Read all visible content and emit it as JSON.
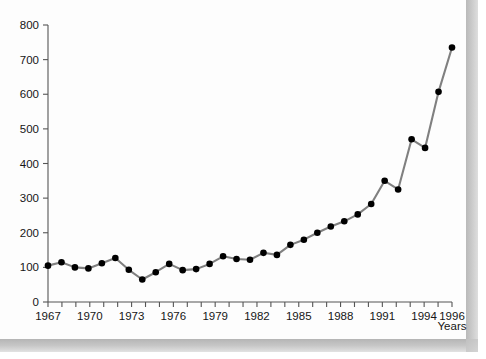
{
  "chart_data": {
    "type": "line",
    "title": "",
    "subtitle": "",
    "xlabel": "Years",
    "ylabel": "",
    "xlim": [
      1967,
      1996
    ],
    "ylim": [
      0,
      800
    ],
    "grid": false,
    "legend": "none",
    "marker": "filled-circle",
    "line_color": "#808080",
    "marker_color": "#000000",
    "axis_color": "#555555",
    "x_tick_labels": [
      "1967",
      "1970",
      "1973",
      "1976",
      "1979",
      "1982",
      "1985",
      "1988",
      "1991",
      "1994",
      "1996"
    ],
    "x_tick_values": [
      1967,
      1970,
      1973,
      1976,
      1979,
      1982,
      1985,
      1988,
      1991,
      1994,
      1996
    ],
    "y_tick_labels": [
      "0",
      "100",
      "200",
      "300",
      "400",
      "500",
      "600",
      "700",
      "800"
    ],
    "y_tick_values": [
      0,
      100,
      200,
      300,
      400,
      500,
      600,
      700,
      800
    ],
    "x": [
      1967,
      1968,
      1969,
      1970,
      1971,
      1972,
      1973,
      1974,
      1975,
      1976,
      1977,
      1978,
      1979,
      1980,
      1981,
      1982,
      1983,
      1984,
      1985,
      1986,
      1987,
      1988,
      1989,
      1990,
      1991,
      1992,
      1993,
      1994,
      1995,
      1996
    ],
    "values": [
      105,
      115,
      100,
      97,
      112,
      127,
      93,
      65,
      86,
      110,
      92,
      95,
      110,
      132,
      124,
      122,
      142,
      136,
      165,
      180,
      200,
      218,
      233,
      253,
      283,
      350,
      325,
      420,
      448,
      440
    ],
    "series": [
      {
        "name": "Series 1",
        "values": [
          105,
          115,
          100,
          97,
          112,
          127,
          93,
          65,
          86,
          110,
          92,
          95,
          110,
          132,
          124,
          122,
          142,
          136,
          165,
          180,
          200,
          218,
          233,
          253,
          283,
          350,
          325,
          420,
          448,
          440
        ]
      }
    ],
    "points": [
      {
        "year": 1967,
        "value": 105
      },
      {
        "year": 1968,
        "value": 115
      },
      {
        "year": 1969,
        "value": 100
      },
      {
        "year": 1970,
        "value": 97
      },
      {
        "year": 1971,
        "value": 112
      },
      {
        "year": 1972,
        "value": 127
      },
      {
        "year": 1973,
        "value": 93
      },
      {
        "year": 1974,
        "value": 65
      },
      {
        "year": 1975,
        "value": 86
      },
      {
        "year": 1976,
        "value": 110
      },
      {
        "year": 1977,
        "value": 92
      },
      {
        "year": 1978,
        "value": 95
      },
      {
        "year": 1979,
        "value": 110
      },
      {
        "year": 1980,
        "value": 132
      },
      {
        "year": 1981,
        "value": 124
      },
      {
        "year": 1982,
        "value": 122
      },
      {
        "year": 1983,
        "value": 142
      },
      {
        "year": 1984,
        "value": 136
      },
      {
        "year": 1985,
        "value": 165
      },
      {
        "year": 1986,
        "value": 180
      },
      {
        "year": 1987,
        "value": 200
      },
      {
        "year": 1988,
        "value": 218
      },
      {
        "year": 1989,
        "value": 233
      },
      {
        "year": 1990,
        "value": 253
      },
      {
        "year": 1991,
        "value": 283
      },
      {
        "year": 1992,
        "value": 350
      },
      {
        "year": 1993,
        "value": 325
      },
      {
        "year": 1994,
        "value": 420
      },
      {
        "year": 1995,
        "value": 448
      },
      {
        "year": 1996,
        "value": 440
      }
    ],
    "points_tail": [
      {
        "year": 1994,
        "value": 470
      },
      {
        "year": 1995,
        "value": 445
      },
      {
        "year": 1996,
        "value": 607
      },
      {
        "year": 1997,
        "value": 735
      }
    ]
  },
  "colors": {
    "background": "#ffffff",
    "panel": "#fdfdfd",
    "line": "#808080",
    "marker": "#000000",
    "axis": "#555555",
    "text": "#161616",
    "bevel_shadow": "#c0c0c0"
  }
}
